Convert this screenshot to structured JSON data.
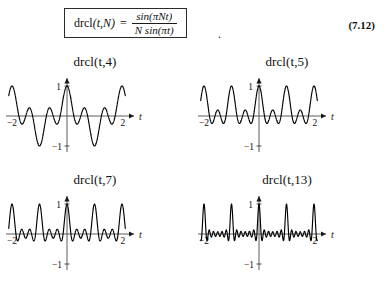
{
  "equation": {
    "lhs_function": "drcl",
    "lhs_args": "(t,N)",
    "equals": "=",
    "numerator": "sin(πNt)",
    "denominator": "N sin(πt)",
    "trailing_punctuation": ".",
    "number": "(7.12)",
    "formula_plain": "drcl(t,N) = sin(πNt) / (N sin(πt))"
  },
  "chart_data": [
    {
      "type": "line",
      "title": "drcl(t,4)",
      "N": 4,
      "xlabel": "t",
      "ylabel": "",
      "xlim": [
        -2.15,
        2.15
      ],
      "ylim": [
        -1.25,
        1.25
      ],
      "xticks": [
        -2,
        2
      ],
      "xticklabels": [
        "−2",
        "2"
      ],
      "yticks": [
        -1,
        1
      ],
      "yticklabels": [
        "−1",
        "1"
      ],
      "grid": false,
      "legend": "none",
      "expression": "sin(pi*4*t)/(4*sin(pi*t))",
      "x": [
        -2.0,
        -1.875,
        -1.75,
        -1.625,
        -1.5,
        -1.375,
        -1.25,
        -1.125,
        -1.0,
        -0.875,
        -0.75,
        -0.625,
        -0.5,
        -0.375,
        -0.25,
        -0.125,
        0.0,
        0.125,
        0.25,
        0.375,
        0.5,
        0.625,
        0.75,
        0.875,
        1.0,
        1.125,
        1.25,
        1.375,
        1.5,
        1.625,
        1.75,
        1.875,
        2.0
      ],
      "values": [
        1.0,
        0.0,
        -0.354,
        0.0,
        0.25,
        0.0,
        -0.354,
        0.0,
        1.0,
        0.0,
        -0.354,
        0.0,
        0.25,
        0.0,
        -0.354,
        0.0,
        1.0,
        0.0,
        -0.354,
        0.0,
        0.25,
        0.0,
        -0.354,
        0.0,
        1.0,
        0.0,
        -0.354,
        0.0,
        0.25,
        0.0,
        -0.354,
        0.0,
        1.0
      ]
    },
    {
      "type": "line",
      "title": "drcl(t,5)",
      "N": 5,
      "xlabel": "t",
      "ylabel": "",
      "xlim": [
        -2.15,
        2.15
      ],
      "ylim": [
        -1.25,
        1.25
      ],
      "xticks": [
        -2,
        2
      ],
      "xticklabels": [
        "−2",
        "2"
      ],
      "yticks": [
        -1,
        1
      ],
      "yticklabels": [
        "−1",
        "1"
      ],
      "grid": false,
      "legend": "none",
      "expression": "sin(pi*5*t)/(5*sin(pi*t))",
      "x": [
        -2.0,
        -1.8,
        -1.6,
        -1.4,
        -1.2,
        -1.0,
        -0.8,
        -0.6,
        -0.4,
        -0.2,
        0.0,
        0.2,
        0.4,
        0.6,
        0.8,
        1.0,
        1.2,
        1.4,
        1.6,
        1.8,
        2.0
      ],
      "values": [
        1.0,
        0.0,
        0.0,
        0.0,
        0.0,
        1.0,
        0.0,
        0.0,
        0.0,
        0.0,
        1.0,
        0.0,
        0.0,
        0.0,
        0.0,
        1.0,
        0.0,
        0.0,
        0.0,
        0.0,
        1.0
      ]
    },
    {
      "type": "line",
      "title": "drcl(t,7)",
      "N": 7,
      "xlabel": "t",
      "ylabel": "",
      "xlim": [
        -2.15,
        2.15
      ],
      "ylim": [
        -1.25,
        1.25
      ],
      "xticks": [
        -2,
        2
      ],
      "xticklabels": [
        "−2",
        "2"
      ],
      "yticks": [
        -1,
        1
      ],
      "yticklabels": [
        "−1",
        "1"
      ],
      "grid": false,
      "legend": "none",
      "expression": "sin(pi*7*t)/(7*sin(pi*t))",
      "x": [
        -2.0,
        -1.5,
        -1.0,
        -0.5,
        0.0,
        0.5,
        1.0,
        1.5,
        2.0
      ],
      "values": [
        1.0,
        0.143,
        1.0,
        0.143,
        1.0,
        0.143,
        1.0,
        0.143,
        1.0
      ]
    },
    {
      "type": "line",
      "title": "drcl(t,13)",
      "N": 13,
      "xlabel": "t",
      "ylabel": "",
      "xlim": [
        -2.15,
        2.15
      ],
      "ylim": [
        -1.25,
        1.25
      ],
      "xticks": [
        -2,
        2
      ],
      "xticklabels": [
        "−2",
        "2"
      ],
      "yticks": [
        -1,
        1
      ],
      "yticklabels": [
        "−1",
        "1"
      ],
      "grid": false,
      "legend": "none",
      "expression": "sin(pi*13*t)/(13*sin(pi*t))",
      "x": [
        -2.0,
        -1.5,
        -1.0,
        -0.5,
        0.0,
        0.5,
        1.0,
        1.5,
        2.0
      ],
      "values": [
        1.0,
        0.077,
        1.0,
        0.077,
        1.0,
        0.077,
        1.0,
        0.077,
        1.0
      ]
    }
  ]
}
